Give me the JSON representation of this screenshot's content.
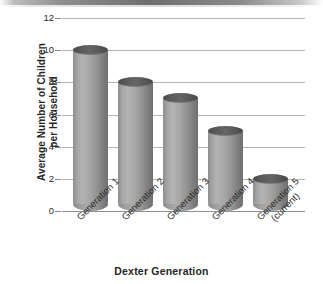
{
  "chart_data": {
    "type": "bar",
    "title": "",
    "xlabel": "Dexter Generation",
    "ylabel_line1": "Average Number of Children",
    "ylabel_line2": "per Household",
    "categories": [
      "Generation 1",
      "Generation 2",
      "Generation 3",
      "Generation 4",
      "Generation 5 (current)"
    ],
    "category_labels": [
      {
        "line1": "Generation 1",
        "line2": ""
      },
      {
        "line1": "Generation 2",
        "line2": ""
      },
      {
        "line1": "Generation 3",
        "line2": ""
      },
      {
        "line1": "Generation 4",
        "line2": ""
      },
      {
        "line1": "Generation 5",
        "line2": "(current)"
      }
    ],
    "values": [
      10,
      8,
      7,
      5,
      2
    ],
    "ylim": [
      0,
      12
    ],
    "ytick_values": [
      0,
      2,
      4,
      6,
      8,
      10,
      12
    ],
    "ytick_labels": [
      "0",
      "2",
      "4",
      "6",
      "8",
      "10",
      "12"
    ],
    "grid": true,
    "legend": "none",
    "bar_style": "3d-cylinder",
    "colors": {
      "bar_body": "#a8a8a8",
      "bar_top": "#585858",
      "gridline": "#b4b4b4",
      "axis_text": "#2b2b2b",
      "background": "#ffffff"
    }
  }
}
